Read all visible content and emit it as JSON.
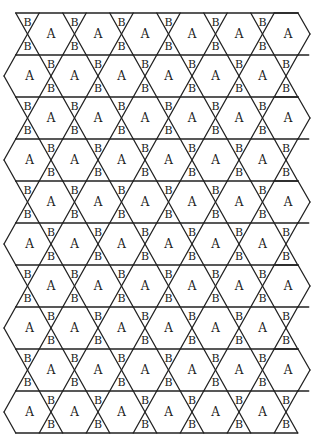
{
  "diagram": {
    "type": "trihexagonal-tiling",
    "labels": {
      "hexagon": "A",
      "triangle": "B"
    },
    "colors": {
      "stroke": "#222222",
      "background": "#ffffff",
      "text": "#222222"
    },
    "geometry": {
      "top_y": 13,
      "row_height": 42,
      "rows": 10,
      "col_spacing": 47,
      "odd_row_first_cross_x": 27.5,
      "even_row_first_cross_x": 51,
      "crossings_per_row": 6,
      "half_width": 11.75,
      "left_edge_x": 4,
      "right_edge_odd": 310,
      "right_edge_even": 297
    }
  }
}
